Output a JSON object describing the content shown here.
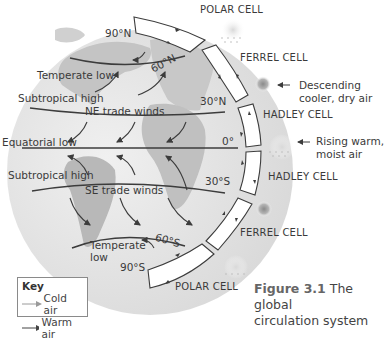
{
  "figure": {
    "number": "Figure 3.1",
    "caption_line1": "The global",
    "caption_line2": "circulation system"
  },
  "latitudes": {
    "n90": "90°N",
    "n60": "60°N",
    "n30": "30°N",
    "eq": "0°",
    "s30": "30°S",
    "s60": "60°S",
    "s90": "90°S"
  },
  "pressure_belts": {
    "temperate_low_n": "Temperate low",
    "subtropical_high_n": "Subtropical high",
    "equatorial_low": "Equatorial low",
    "subtropical_high_s": "Subtropical high",
    "temperate_low_s_line1": "Temperate",
    "temperate_low_s_line2": "low"
  },
  "winds": {
    "ne_trade": "NE trade winds",
    "se_trade": "SE trade winds"
  },
  "cells": {
    "polar_n": "POLAR CELL",
    "ferrel_n": "FERREL CELL",
    "hadley_n": "HADLEY CELL",
    "hadley_s": "HADLEY CELL",
    "ferrel_s": "FERREL CELL",
    "polar_s": "POLAR CELL"
  },
  "annotations": {
    "descending_line1": "Descending",
    "descending_line2": "cooler, dry air",
    "rising_line1": "Rising warm,",
    "rising_line2": "moist air"
  },
  "key": {
    "title": "Key",
    "cold": "Cold air",
    "warm": "Warm air",
    "cold_color": "#9a9a9a",
    "warm_color": "#444444"
  },
  "colors": {
    "globe": "#e6e6e6",
    "land": "#bdbdbd",
    "line": "#3c3c3c"
  }
}
